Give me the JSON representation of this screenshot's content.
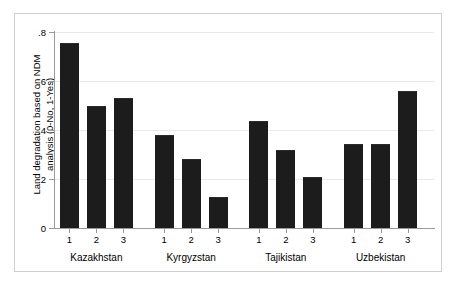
{
  "chart_data": {
    "type": "bar",
    "title": "",
    "subtitle": "",
    "xlabel": "",
    "ylabel": "Land degradation based on NDM\nanalysis (0-No, 1-Yes)",
    "ylim": [
      0,
      0.8
    ],
    "ytick_labels": [
      "0",
      ".2",
      ".4",
      ".6",
      ".8"
    ],
    "ytick_values": [
      0,
      0.2,
      0.4,
      0.6,
      0.8
    ],
    "grid": true,
    "grid_axis": "y",
    "legend": false,
    "legend_position": "none",
    "bar_color": "#1c1c1c",
    "groups": [
      {
        "label": "Kazakhstan",
        "categories": [
          "1",
          "2",
          "3"
        ],
        "values": [
          0.755,
          0.5,
          0.53
        ]
      },
      {
        "label": "Kyrgyzstan",
        "categories": [
          "1",
          "2",
          "3"
        ],
        "values": [
          0.38,
          0.28,
          0.127
        ]
      },
      {
        "label": "Tajikistan",
        "categories": [
          "1",
          "2",
          "3"
        ],
        "values": [
          0.435,
          0.32,
          0.21
        ]
      },
      {
        "label": "Uzbekistan",
        "categories": [
          "1",
          "2",
          "3"
        ],
        "values": [
          0.343,
          0.343,
          0.56
        ]
      }
    ],
    "categories": [
      "1",
      "2",
      "3"
    ],
    "series": [
      {
        "name": "Kazakhstan",
        "values": [
          0.755,
          0.5,
          0.53
        ]
      },
      {
        "name": "Kyrgyzstan",
        "values": [
          0.38,
          0.28,
          0.127
        ]
      },
      {
        "name": "Tajikistan",
        "values": [
          0.435,
          0.32,
          0.21
        ]
      },
      {
        "name": "Uzbekistan",
        "values": [
          0.343,
          0.343,
          0.56
        ]
      }
    ]
  }
}
